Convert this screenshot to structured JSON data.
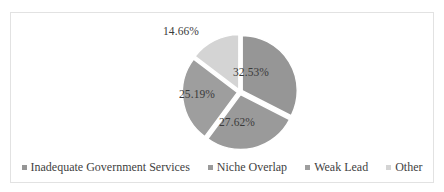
{
  "chart_data": {
    "type": "pie",
    "title": "",
    "subtitle": "",
    "xlabel": "",
    "ylabel": "",
    "grid": false,
    "legend_position": "bottom",
    "start_angle_deg": 0,
    "exploded": true,
    "categories": [
      "Inadequate Government Services",
      "Niche Overlap",
      "Weak Lead",
      "Other"
    ],
    "values": [
      32.53,
      27.62,
      25.19,
      14.66
    ],
    "value_labels": [
      "32.53%",
      "27.62%",
      "25.19%",
      "14.66%"
    ],
    "colors": [
      "#969696",
      "#9a9a9a",
      "#9e9e9e",
      "#d4d4d4"
    ],
    "slices": [
      {
        "label": "Inadequate Government Services",
        "value": 32.53,
        "value_label": "32.53%",
        "color": "#969696",
        "start_deg": 0,
        "end_deg": 117.108
      },
      {
        "label": "Niche Overlap",
        "value": 27.62,
        "value_label": "27.62%",
        "color": "#9a9a9a",
        "start_deg": 117.108,
        "end_deg": 216.54
      },
      {
        "label": "Weak Lead",
        "value": 25.19,
        "value_label": "25.19%",
        "color": "#9e9e9e",
        "start_deg": 216.54,
        "end_deg": 307.224
      },
      {
        "label": "Other",
        "value": 14.66,
        "value_label": "14.66%",
        "color": "#d4d4d4",
        "start_deg": 307.224,
        "end_deg": 360
      }
    ]
  },
  "legend": {
    "items": [
      {
        "label": "Inadequate Government Services",
        "color": "#969696"
      },
      {
        "label": "Niche Overlap",
        "color": "#9a9a9a"
      },
      {
        "label": "Weak Lead",
        "color": "#9e9e9e"
      },
      {
        "label": "Other",
        "color": "#d4d4d4"
      }
    ]
  },
  "frame": {
    "border_color": "#e2e2e2",
    "background": "#ffffff"
  }
}
